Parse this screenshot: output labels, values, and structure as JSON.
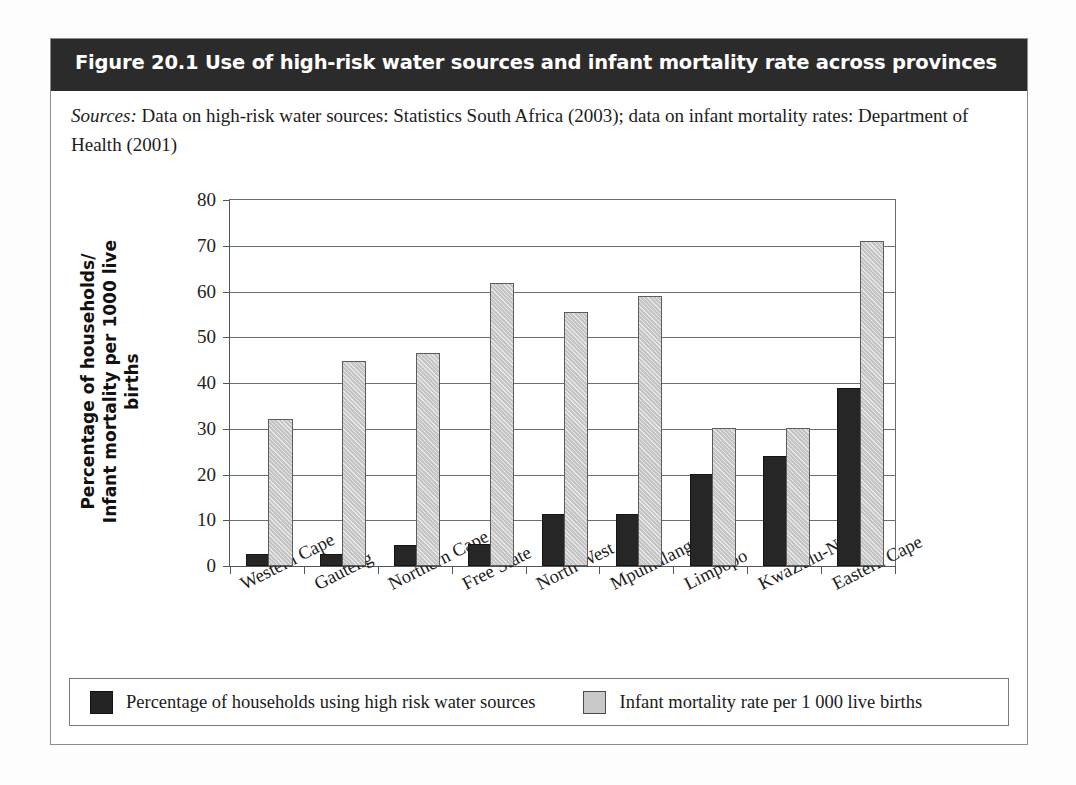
{
  "figure": {
    "title": "Figure 20.1 Use of high-risk water sources and infant mortality rate across provinces",
    "sources_label": "Sources:",
    "sources_text": " Data on high-risk water sources: Statistics South Africa (2003); data on infant mortality rates: Department of Health (2001)"
  },
  "colors": {
    "header_band": "#2b2b2b",
    "series_dark": "#262626",
    "series_light": "#cfcfcf",
    "gridline": "#6e6e6e",
    "frame": "#8c8c8c"
  },
  "legend": {
    "items": [
      {
        "swatch": "dark-swatch",
        "label": "Percentage of households using high risk water sources"
      },
      {
        "swatch": "light-swatch",
        "label": "Infant mortality rate per 1 000 live births"
      }
    ]
  },
  "chart_data": {
    "type": "bar",
    "title": "Use of high-risk water sources and infant mortality rate across provinces",
    "xlabel": "",
    "ylabel": "Percentage of households/\nInfant mortality per 1000 live births",
    "ylim": [
      0,
      80
    ],
    "yticks": [
      0,
      10,
      20,
      30,
      40,
      50,
      60,
      70,
      80
    ],
    "grid": true,
    "legend_position": "bottom",
    "categories": [
      "Western Cape",
      "Gauteng",
      "Northern Cape",
      "Free State",
      "North West",
      "Mpumalanga",
      "Limpopo",
      "KwaZulu-Natal",
      "Eastern Cape"
    ],
    "series": [
      {
        "name": "Percentage of households using high risk water sources",
        "color": "#262626",
        "values": [
          2.2,
          2.2,
          4.1,
          4.3,
          11.0,
          10.9,
          19.7,
          23.6,
          38.5
        ]
      },
      {
        "name": "Infant mortality rate per 1 000 live births",
        "color": "#cfcfcf",
        "values": [
          31.7,
          44.4,
          46.1,
          61.4,
          55.0,
          58.5,
          29.8,
          29.7,
          70.7
        ]
      }
    ]
  }
}
